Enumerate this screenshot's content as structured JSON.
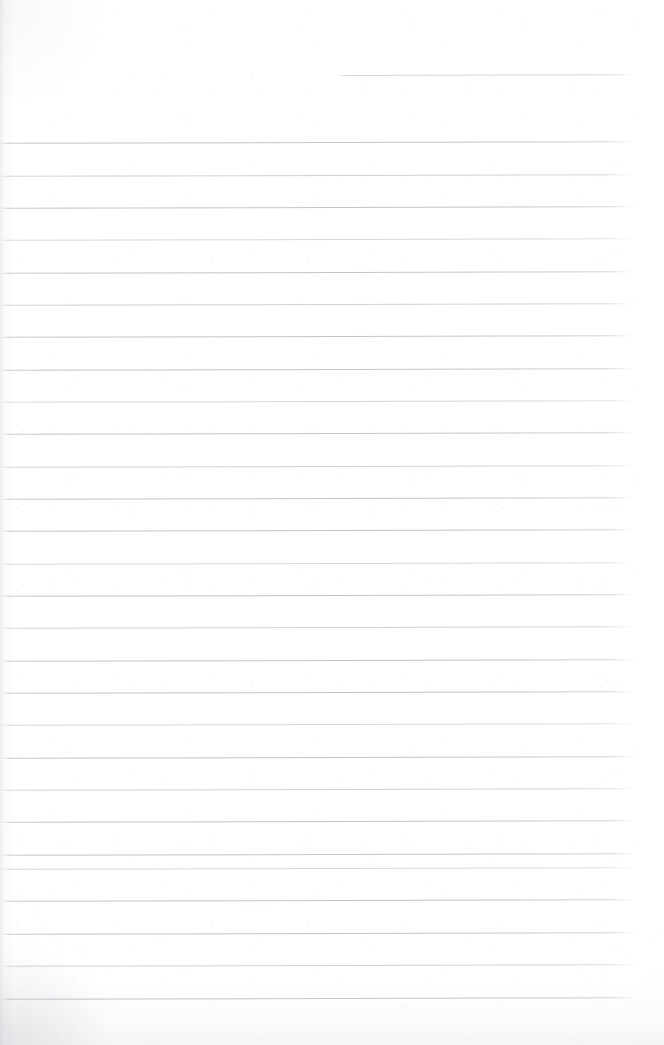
{
  "document": {
    "kind": "scanned-page",
    "description": "Blank ruled notebook page, scanned",
    "page_width": 664,
    "page_height": 1045,
    "background_color": "#ffffff",
    "rule_color": "#b0b5bc",
    "rule_thickness_px": 1,
    "rule_spacing_px": 32.3,
    "skew_degrees": -0.13,
    "has_text": false,
    "text_content": "",
    "visible_text_lines": []
  },
  "ruling": {
    "left_margin_x": 0,
    "right_margin_x": 633,
    "first_rule_y": 75,
    "last_rule_y": 998,
    "partial_first_rule": {
      "y": 75,
      "start_x": 340,
      "end_x": 633,
      "note": "short rule, upper right"
    },
    "rules": [
      {
        "y": 75,
        "x": 340,
        "w": 293,
        "tone": "soft"
      },
      {
        "y": 142,
        "x": 0,
        "w": 633,
        "tone": "normal"
      },
      {
        "y": 175,
        "x": 0,
        "w": 633,
        "tone": "dim"
      },
      {
        "y": 207,
        "x": 0,
        "w": 633,
        "tone": "normal"
      },
      {
        "y": 239,
        "x": 0,
        "w": 633,
        "tone": "soft"
      },
      {
        "y": 272,
        "x": 0,
        "w": 633,
        "tone": "normal"
      },
      {
        "y": 304,
        "x": 0,
        "w": 633,
        "tone": "dim"
      },
      {
        "y": 336,
        "x": 0,
        "w": 633,
        "tone": "normal"
      },
      {
        "y": 369,
        "x": 0,
        "w": 633,
        "tone": "normal"
      },
      {
        "y": 401,
        "x": 0,
        "w": 633,
        "tone": "soft"
      },
      {
        "y": 433,
        "x": 0,
        "w": 633,
        "tone": "normal"
      },
      {
        "y": 466,
        "x": 0,
        "w": 633,
        "tone": "dim"
      },
      {
        "y": 498,
        "x": 0,
        "w": 633,
        "tone": "normal"
      },
      {
        "y": 530,
        "x": 0,
        "w": 633,
        "tone": "normal"
      },
      {
        "y": 563,
        "x": 0,
        "w": 633,
        "tone": "soft"
      },
      {
        "y": 595,
        "x": 0,
        "w": 633,
        "tone": "normal"
      },
      {
        "y": 627,
        "x": 0,
        "w": 633,
        "tone": "dim"
      },
      {
        "y": 660,
        "x": 0,
        "w": 633,
        "tone": "normal"
      },
      {
        "y": 692,
        "x": 0,
        "w": 633,
        "tone": "normal"
      },
      {
        "y": 724,
        "x": 0,
        "w": 633,
        "tone": "soft"
      },
      {
        "y": 757,
        "x": 0,
        "w": 633,
        "tone": "normal"
      },
      {
        "y": 789,
        "x": 0,
        "w": 633,
        "tone": "dim"
      },
      {
        "y": 821,
        "x": 0,
        "w": 633,
        "tone": "normal"
      },
      {
        "y": 854,
        "x": 0,
        "w": 633,
        "tone": "normal"
      },
      {
        "y": 868,
        "x": 0,
        "w": 633,
        "tone": "soft"
      },
      {
        "y": 900,
        "x": 0,
        "w": 633,
        "tone": "normal"
      },
      {
        "y": 933,
        "x": 0,
        "w": 633,
        "tone": "normal"
      },
      {
        "y": 965,
        "x": 0,
        "w": 633,
        "tone": "dim"
      },
      {
        "y": 998,
        "x": 0,
        "w": 633,
        "tone": "normal"
      }
    ]
  },
  "artifacts": {
    "left_edge_shadow": true,
    "bottom_edge_shadow": true,
    "bottom_left_smudge": true,
    "paper_grain": true
  }
}
